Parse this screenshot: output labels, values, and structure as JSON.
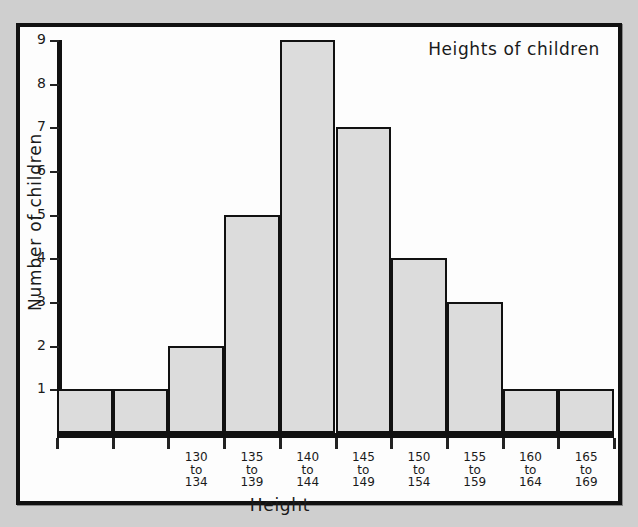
{
  "chart_data": {
    "type": "bar",
    "title": "Heights of children",
    "xlabel": "Height",
    "ylabel": "Number of children",
    "ylim": [
      0,
      9
    ],
    "ytick_labels": [
      "1",
      "2",
      "3",
      "4",
      "5",
      "6",
      "7",
      "8",
      "9"
    ],
    "ytick_values": [
      1,
      2,
      3,
      4,
      5,
      6,
      7,
      8,
      9
    ],
    "grid": false,
    "legend": "none",
    "categories": [
      "",
      "",
      "130 to 134",
      "135 to 139",
      "140 to 144",
      "145 to 149",
      "150 to 154",
      "155 to 159",
      "160 to 164",
      "165 to 169"
    ],
    "values": [
      1,
      1,
      2,
      5,
      9,
      7,
      4,
      3,
      1,
      1
    ],
    "bars": [
      {
        "label_line1": "",
        "label_line2": "",
        "label_line3": "",
        "value": 1
      },
      {
        "label_line1": "",
        "label_line2": "",
        "label_line3": "",
        "value": 1
      },
      {
        "label_line1": "130",
        "label_line2": "to",
        "label_line3": "134",
        "value": 2
      },
      {
        "label_line1": "135",
        "label_line2": "to",
        "label_line3": "139",
        "value": 5
      },
      {
        "label_line1": "140",
        "label_line2": "to",
        "label_line3": "144",
        "value": 9
      },
      {
        "label_line1": "145",
        "label_line2": "to",
        "label_line3": "149",
        "value": 7
      },
      {
        "label_line1": "150",
        "label_line2": "to",
        "label_line3": "154",
        "value": 4
      },
      {
        "label_line1": "155",
        "label_line2": "to",
        "label_line3": "159",
        "value": 3
      },
      {
        "label_line1": "160",
        "label_line2": "to",
        "label_line3": "164",
        "value": 1
      },
      {
        "label_line1": "165",
        "label_line2": "to",
        "label_line3": "169",
        "value": 1
      }
    ],
    "colors": {
      "bar_fill": "#dcdcdc",
      "bar_stroke": "#111111",
      "axis": "#111111",
      "text": "#1a1a1a",
      "plot_background": "#fdfdfd",
      "page_background": "#cfcfcf"
    }
  }
}
